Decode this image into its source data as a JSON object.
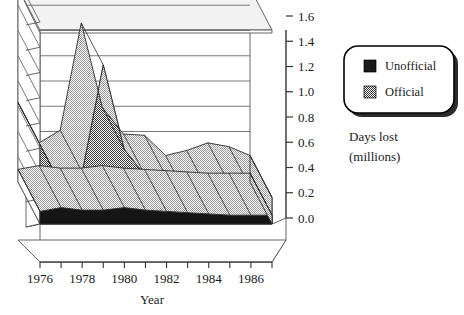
{
  "chart_data": {
    "type": "area",
    "title": "",
    "subtitle": "",
    "xlabel": "Year",
    "ylabel": "Days lost (millions)",
    "ylim": [
      0.0,
      1.6
    ],
    "ytick_labels": [
      "0.0",
      "0.2",
      "0.4",
      "0.6",
      "0.8",
      "1.0",
      "1.2",
      "1.4",
      "1.6"
    ],
    "ytick_values": [
      0.0,
      0.2,
      0.4,
      0.6,
      0.8,
      1.0,
      1.2,
      1.4,
      1.6
    ],
    "grid": true,
    "stacked": true,
    "three_d": true,
    "legend_position": "right",
    "x": [
      1976,
      1977,
      1978,
      1979,
      1980,
      1981,
      1982,
      1983,
      1984,
      1985,
      1986,
      1987
    ],
    "xtick_labels": [
      "1976",
      "1978",
      "1980",
      "1982",
      "1984",
      "1986"
    ],
    "xtick_values": [
      1976,
      1978,
      1980,
      1982,
      1984,
      1986
    ],
    "categories": [
      "1976",
      "1977",
      "1978",
      "1979",
      "1980",
      "1981",
      "1982",
      "1983",
      "1984",
      "1985",
      "1986",
      "1987"
    ],
    "series": [
      {
        "name": "Unofficial",
        "color": "#1a1a1a",
        "pattern": "solid",
        "values": [
          0.1,
          0.13,
          0.11,
          0.11,
          0.13,
          0.11,
          0.1,
          0.09,
          0.08,
          0.07,
          0.07,
          0.07
        ]
      },
      {
        "name": "Official",
        "color": "#595959",
        "pattern": "checker",
        "values": [
          0.53,
          0.18,
          0.3,
          1.15,
          0.46,
          0.27,
          0.27,
          0.12,
          0.17,
          0.24,
          0.21,
          0.14
        ]
      }
    ],
    "totals": [
      0.63,
      0.31,
      0.41,
      1.26,
      0.59,
      0.38,
      0.37,
      0.21,
      0.25,
      0.31,
      0.28,
      0.21
    ]
  },
  "axes": {
    "y_ticks": [
      "1.6",
      "1.4",
      "1.2",
      "1.0",
      "0.8",
      "0.6",
      "0.4",
      "0.2",
      "0.0"
    ],
    "x_ticks": [
      "1976",
      "1978",
      "1980",
      "1982",
      "1984",
      "1986"
    ],
    "x_title": "Year"
  },
  "legend": {
    "items": [
      {
        "label": "Unofficial",
        "swatch": "solid-black-swatch"
      },
      {
        "label": "Official",
        "swatch": "checker-gray-swatch"
      }
    ]
  },
  "unit_caption": {
    "line1": "Days lost",
    "line2": "(millions)"
  }
}
